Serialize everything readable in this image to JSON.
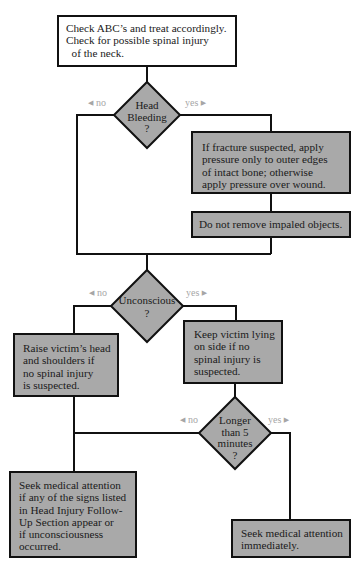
{
  "colors": {
    "line": "#111111",
    "box_white": "#ffffff",
    "box_gray": "#a9a9a9",
    "label_gray": "#a6a6a6"
  },
  "start": {
    "lines": [
      "Check ABC’s and treat accordingly.",
      "Check for possible spinal injury",
      "  of the neck."
    ]
  },
  "decision_head_bleeding": {
    "lines": [
      "Head",
      "Bleeding",
      "?"
    ],
    "no_label": "no",
    "yes_label": "yes"
  },
  "fracture_box": {
    "lines": [
      "If fracture suspected, apply",
      "pressure only to outer edges",
      "of intact bone; otherwise",
      "apply pressure over wound."
    ]
  },
  "impaled_box": {
    "lines": [
      "Do not remove impaled objects."
    ]
  },
  "decision_unconscious": {
    "lines": [
      "Unconscious",
      "?"
    ],
    "no_label": "no",
    "yes_label": "yes"
  },
  "raise_box": {
    "lines": [
      "Raise victim’s head",
      "and shoulders if",
      "no spinal injury",
      "is suspected."
    ]
  },
  "keep_box": {
    "lines": [
      "Keep victim lying",
      "on side if no",
      "spinal injury is",
      "suspected."
    ]
  },
  "decision_longer": {
    "lines": [
      "Longer",
      "than 5",
      "minutes",
      "?"
    ],
    "no_label": "no",
    "yes_label": "yes"
  },
  "followup_box": {
    "lines": [
      "Seek medical attention",
      "if any of the signs listed",
      "in Head Injury Follow-",
      "Up Section appear or",
      "if unconsciousness",
      "occurred."
    ]
  },
  "immediate_box": {
    "lines": [
      "Seek medical attention",
      "immediately."
    ]
  },
  "icons": {
    "left_arrow": "◀",
    "right_arrow": "▶"
  }
}
